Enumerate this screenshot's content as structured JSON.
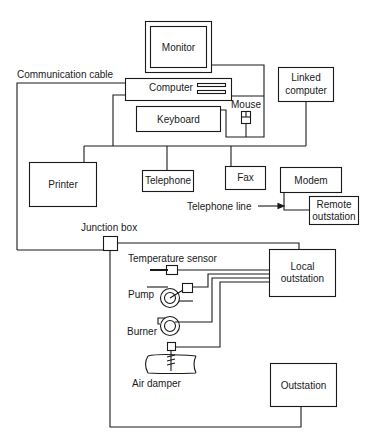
{
  "diagram": {
    "nodes": {
      "monitor": "Monitor",
      "computer": "Computer",
      "keyboard": "Keyboard",
      "mouse": "Mouse",
      "linked_computer_line1": "Linked",
      "linked_computer_line2": "computer",
      "printer": "Printer",
      "telephone": "Telephone",
      "fax": "Fax",
      "modem": "Modem",
      "remote_outstation_line1": "Remote",
      "remote_outstation_line2": "outstation",
      "junction_box": "Junction box",
      "local_outstation_line1": "Local",
      "local_outstation_line2": "outstation",
      "outstation": "Outstation",
      "temperature_sensor": "Temperature sensor",
      "pump": "Pump",
      "burner": "Burner",
      "air_damper": "Air damper"
    },
    "annotations": {
      "communication_cable": "Communication cable",
      "telephone_line": "Telephone line"
    },
    "colors": {
      "line": "#1a1a1a",
      "background": "#ffffff"
    }
  }
}
